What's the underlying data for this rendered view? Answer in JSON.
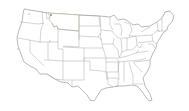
{
  "map": {
    "title": "United States",
    "region": "Contiguous United States",
    "highlighted_state": "Montana",
    "colors": {
      "highlight_fill": "#f7e3c3",
      "state_fill": "#ffffff",
      "border": "#9a9a9a",
      "background": "#ffffff"
    }
  }
}
